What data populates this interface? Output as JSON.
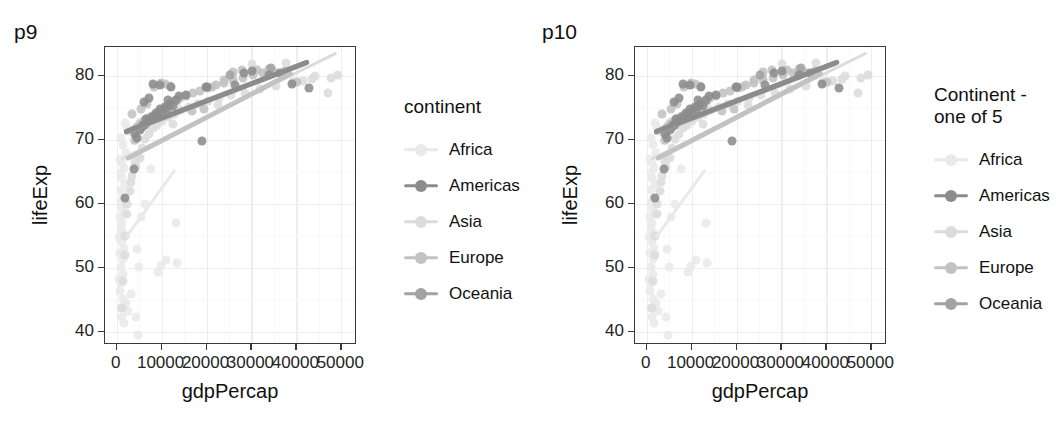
{
  "figure": {
    "background": "#ffffff",
    "panel_border_color": "#3a3a3a",
    "grid_color": "#eeeeee"
  },
  "palette": {
    "Africa": "#e9e9e9",
    "Americas": "#8c8c8c",
    "Asia": "#dcdcdc",
    "Europe": "#c2c2c2",
    "Oceania": "#a2a2a2"
  },
  "plots": [
    {
      "label": "p9",
      "legend": {
        "title": "continent",
        "items": [
          {
            "label": "Africa",
            "color_key": "Africa"
          },
          {
            "label": "Americas",
            "color_key": "Americas"
          },
          {
            "label": "Asia",
            "color_key": "Asia"
          },
          {
            "label": "Europe",
            "color_key": "Europe"
          },
          {
            "label": "Oceania",
            "color_key": "Oceania"
          }
        ]
      }
    },
    {
      "label": "p10",
      "legend": {
        "title": "Continent -\none of 5",
        "items": [
          {
            "label": "Africa",
            "color_key": "Africa"
          },
          {
            "label": "Americas",
            "color_key": "Americas"
          },
          {
            "label": "Asia",
            "color_key": "Asia"
          },
          {
            "label": "Europe",
            "color_key": "Europe"
          },
          {
            "label": "Oceania",
            "color_key": "Oceania"
          }
        ]
      }
    }
  ],
  "chart_data": {
    "type": "scatter",
    "title": "",
    "xlabel": "gdpPercap",
    "ylabel": "lifeExp",
    "xlim": [
      -2600,
      53500
    ],
    "ylim": [
      38.0,
      84.5
    ],
    "xticks": [
      0,
      10000,
      20000,
      30000,
      40000,
      50000
    ],
    "xticklabels": [
      "0",
      "10000",
      "20000",
      "30000",
      "40000",
      "50000"
    ],
    "yticks": [
      40,
      50,
      60,
      70,
      80
    ],
    "yticklabels": [
      "40",
      "50",
      "60",
      "70",
      "80"
    ],
    "grid": true,
    "legend_position": "right",
    "legend_title": "continent",
    "series": [
      {
        "name": "Africa",
        "color": "#e9e9e9",
        "points": [
          [
            1200,
            42.4
          ],
          [
            880,
            43.8
          ],
          [
            1400,
            45.2
          ],
          [
            700,
            46.5
          ],
          [
            1050,
            47.6
          ],
          [
            620,
            48.3
          ],
          [
            1500,
            49.1
          ],
          [
            940,
            50.2
          ],
          [
            1320,
            51.4
          ],
          [
            800,
            52.3
          ],
          [
            1700,
            53.1
          ],
          [
            1100,
            54.0
          ],
          [
            600,
            54.8
          ],
          [
            1450,
            55.5
          ],
          [
            980,
            56.2
          ],
          [
            1250,
            57.0
          ],
          [
            760,
            57.9
          ],
          [
            1600,
            58.6
          ],
          [
            1150,
            59.4
          ],
          [
            860,
            60.1
          ],
          [
            1350,
            61.0
          ],
          [
            1020,
            62.2
          ],
          [
            1800,
            63.1
          ],
          [
            1240,
            64.0
          ],
          [
            900,
            64.8
          ],
          [
            1560,
            65.6
          ],
          [
            1120,
            66.4
          ],
          [
            700,
            67.1
          ],
          [
            2100,
            68.0
          ],
          [
            1480,
            69.2
          ],
          [
            1050,
            70.3
          ],
          [
            3200,
            71.2
          ],
          [
            2400,
            72.0
          ],
          [
            1900,
            72.6
          ],
          [
            4700,
            39.6
          ],
          [
            4200,
            42.4
          ],
          [
            4600,
            53.0
          ],
          [
            4900,
            50.1
          ],
          [
            9300,
            49.4
          ],
          [
            9800,
            50.3
          ],
          [
            13200,
            57.0
          ],
          [
            13500,
            50.8
          ],
          [
            10900,
            51.2
          ],
          [
            5500,
            58.0
          ],
          [
            6200,
            60.0
          ],
          [
            7600,
            65.5
          ],
          [
            3100,
            46.0
          ],
          [
            2000,
            44.5
          ],
          [
            1600,
            41.5
          ],
          [
            2600,
            43.3
          ],
          [
            5200,
            72.8
          ],
          [
            11100,
            73.9
          ],
          [
            12100,
            74.5
          ],
          [
            3900,
            69.8
          ]
        ]
      },
      {
        "name": "Americas",
        "color": "#8c8c8c",
        "points": [
          [
            1960,
            60.9
          ],
          [
            3800,
            65.5
          ],
          [
            4600,
            70.3
          ],
          [
            5200,
            71.6
          ],
          [
            6300,
            72.4
          ],
          [
            7200,
            72.9
          ],
          [
            8400,
            73.5
          ],
          [
            9100,
            74.0
          ],
          [
            10200,
            74.4
          ],
          [
            11300,
            74.9
          ],
          [
            12500,
            75.3
          ],
          [
            4100,
            71.0
          ],
          [
            5600,
            72.0
          ],
          [
            6900,
            73.0
          ],
          [
            7900,
            73.6
          ],
          [
            8700,
            74.2
          ],
          [
            9600,
            74.8
          ],
          [
            10800,
            75.2
          ],
          [
            5900,
            72.3
          ],
          [
            6600,
            73.2
          ],
          [
            11900,
            75.6
          ],
          [
            13200,
            76.2
          ],
          [
            8100,
            78.8
          ],
          [
            9700,
            78.6
          ],
          [
            11500,
            76.3
          ],
          [
            18900,
            69.8
          ],
          [
            19800,
            78.2
          ],
          [
            20100,
            78.3
          ],
          [
            26400,
            78.5
          ],
          [
            28300,
            80.5
          ],
          [
            30200,
            80.7
          ],
          [
            33900,
            80.2
          ],
          [
            36300,
            80.4
          ],
          [
            39100,
            78.7
          ],
          [
            42900,
            78.1
          ],
          [
            6100,
            75.9
          ],
          [
            7300,
            76.5
          ],
          [
            12000,
            78.3
          ],
          [
            13800,
            76.8
          ],
          [
            15400,
            77.0
          ]
        ]
      },
      {
        "name": "Asia",
        "color": "#dcdcdc",
        "points": [
          [
            1100,
            43.8
          ],
          [
            1900,
            55.0
          ],
          [
            2300,
            58.5
          ],
          [
            2900,
            62.0
          ],
          [
            3400,
            64.4
          ],
          [
            4100,
            66.5
          ],
          [
            4800,
            67.5
          ],
          [
            5600,
            68.8
          ],
          [
            6400,
            70.2
          ],
          [
            7200,
            71.0
          ],
          [
            8100,
            71.8
          ],
          [
            9000,
            72.4
          ],
          [
            10100,
            73.0
          ],
          [
            11400,
            73.6
          ],
          [
            12800,
            74.1
          ],
          [
            14200,
            74.7
          ],
          [
            16000,
            75.2
          ],
          [
            18100,
            75.6
          ],
          [
            20300,
            76.1
          ],
          [
            22800,
            76.5
          ],
          [
            25500,
            77.0
          ],
          [
            28600,
            77.4
          ],
          [
            31900,
            77.9
          ],
          [
            35400,
            78.4
          ],
          [
            39200,
            79.0
          ],
          [
            43400,
            79.5
          ],
          [
            47700,
            79.7
          ],
          [
            49300,
            80.1
          ],
          [
            2200,
            60.0
          ],
          [
            3100,
            63.4
          ],
          [
            4400,
            65.8
          ],
          [
            5100,
            67.2
          ],
          [
            22600,
            75.5
          ],
          [
            30100,
            81.9
          ],
          [
            33400,
            80.4
          ],
          [
            25900,
            79.9
          ],
          [
            47100,
            77.4
          ],
          [
            44200,
            80.0
          ],
          [
            37800,
            82.0
          ],
          [
            41500,
            79.2
          ],
          [
            1500,
            48.0
          ],
          [
            1800,
            52.0
          ],
          [
            12500,
            72.5
          ]
        ]
      },
      {
        "name": "Europe",
        "color": "#c2c2c2",
        "points": [
          [
            5200,
            72.5
          ],
          [
            6100,
            73.0
          ],
          [
            7000,
            73.4
          ],
          [
            7900,
            73.8
          ],
          [
            8700,
            74.1
          ],
          [
            9600,
            74.5
          ],
          [
            10400,
            74.9
          ],
          [
            11200,
            75.3
          ],
          [
            12100,
            75.7
          ],
          [
            13000,
            76.1
          ],
          [
            14200,
            76.5
          ],
          [
            15500,
            76.9
          ],
          [
            17000,
            77.3
          ],
          [
            18600,
            77.7
          ],
          [
            20300,
            78.1
          ],
          [
            22100,
            78.5
          ],
          [
            24000,
            78.9
          ],
          [
            26000,
            79.3
          ],
          [
            28100,
            79.7
          ],
          [
            30300,
            80.1
          ],
          [
            32600,
            80.4
          ],
          [
            35000,
            80.6
          ],
          [
            37500,
            80.8
          ],
          [
            40100,
            79.0
          ],
          [
            3900,
            71.5
          ],
          [
            4500,
            72.0
          ],
          [
            9900,
            78.9
          ],
          [
            11800,
            78.4
          ],
          [
            13500,
            76.0
          ],
          [
            16800,
            74.5
          ],
          [
            19500,
            74.9
          ],
          [
            21200,
            78.2
          ],
          [
            23900,
            79.4
          ],
          [
            25800,
            80.6
          ],
          [
            27900,
            80.9
          ],
          [
            31200,
            80.9
          ],
          [
            33800,
            81.0
          ],
          [
            36700,
            80.3
          ],
          [
            8300,
            78.3
          ],
          [
            6800,
            75.6
          ],
          [
            5400,
            74.8
          ],
          [
            4000,
            70.0
          ],
          [
            3500,
            74.0
          ],
          [
            10700,
            78.7
          ]
        ]
      },
      {
        "name": "Oceania",
        "color": "#a2a2a2",
        "points": [
          [
            34400,
            81.2
          ],
          [
            25200,
            80.2
          ]
        ]
      }
    ],
    "trendlines": [
      {
        "name": "Africa",
        "color": "#e9e9e9",
        "x0": 2400,
        "y0": 54.8,
        "x1": 13400,
        "y1": 65.4
      },
      {
        "name": "Americas",
        "color": "#8c8c8c",
        "x0": 1900,
        "y0": 71.2,
        "x1": 43000,
        "y1": 82.2
      },
      {
        "name": "Asia",
        "color": "#dcdcdc",
        "x0": 1200,
        "y0": 67.0,
        "x1": 49200,
        "y1": 83.6
      },
      {
        "name": "Europe",
        "color": "#c2c2c2",
        "x0": 2400,
        "y0": 67.1,
        "x1": 39500,
        "y1": 80.6
      },
      {
        "name": "Oceania",
        "color": "#a2a2a2",
        "x0": 1900,
        "y0": 71.1,
        "x1": 42500,
        "y1": 82.1
      }
    ]
  }
}
